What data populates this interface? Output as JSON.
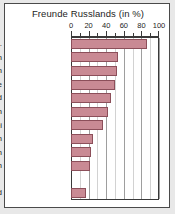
{
  "chart_data": {
    "type": "bar",
    "orientation": "horizontal",
    "title": "Freunde Russlands (in %)",
    "xlabel": "",
    "ylabel": "",
    "xlim": [
      0,
      100
    ],
    "grid": true,
    "legend": "none",
    "tick_labels": [
      "0",
      "20",
      "40",
      "60",
      "80",
      "100"
    ],
    "tick_values": [
      0,
      20,
      40,
      60,
      80,
      100
    ],
    "minor_tick_step": 10,
    "categories": [
      "Weißrussld.",
      "Indien",
      "Kasachstan",
      "Ukraine",
      "Finnland",
      "Serbien",
      "Slowakei",
      "Turkmenistan",
      "Armenien",
      "Frankreich",
      "",
      "Deutschland"
    ],
    "values": [
      86,
      53,
      52,
      50,
      45,
      42,
      36,
      25,
      23,
      22,
      null,
      17
    ],
    "bar_color": "#c98a94",
    "bar_border_color": "#8c4f5a",
    "grid_color": "#9e9e9e",
    "frame_color": "#3a3a3a",
    "background": "#ffffff",
    "page_background": "#e8e8e8"
  }
}
